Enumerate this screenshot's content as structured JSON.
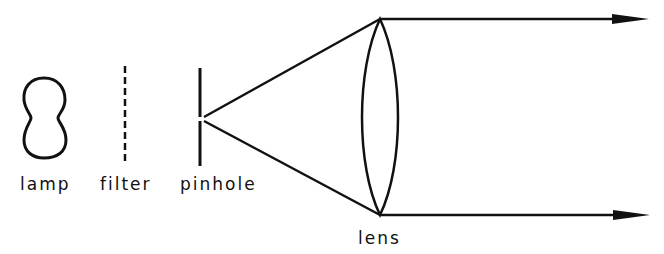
{
  "diagram": {
    "type": "optical-collimator-schematic",
    "stroke_color": "#111111",
    "background": "#ffffff",
    "components": [
      {
        "id": "lamp",
        "label": "lamp",
        "shape": "peanut-outline"
      },
      {
        "id": "filter",
        "label": "filter",
        "shape": "dashed-vertical-line"
      },
      {
        "id": "pinhole",
        "label": "pinhole",
        "shape": "vertical-line-with-gap"
      },
      {
        "id": "lens",
        "label": "lens",
        "shape": "biconvex-lens"
      }
    ],
    "rays": [
      {
        "from": "pinhole",
        "to": "lens-top",
        "then": "parallel-arrow-right"
      },
      {
        "from": "pinhole",
        "to": "lens-bottom",
        "then": "parallel-arrow-right"
      }
    ]
  },
  "labels": {
    "lamp": "lamp",
    "filter": "filter",
    "pinhole": "pinhole",
    "lens": "lens"
  }
}
